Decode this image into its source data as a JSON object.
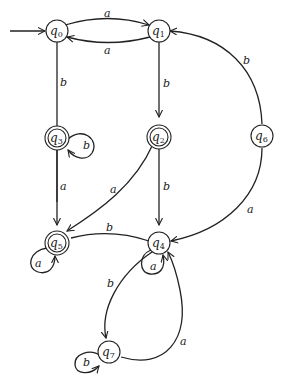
{
  "diagram": {
    "type": "finite-automaton",
    "start_state": "q0",
    "states": [
      {
        "id": "q0",
        "label": "q",
        "sub": "0",
        "accepting": false
      },
      {
        "id": "q1",
        "label": "q",
        "sub": "1",
        "accepting": false
      },
      {
        "id": "q2",
        "label": "q",
        "sub": "2",
        "accepting": true
      },
      {
        "id": "q3",
        "label": "q",
        "sub": "3",
        "accepting": true
      },
      {
        "id": "q4",
        "label": "q",
        "sub": "4",
        "accepting": false
      },
      {
        "id": "q5",
        "label": "q",
        "sub": "5",
        "accepting": true
      },
      {
        "id": "q6",
        "label": "q",
        "sub": "6",
        "accepting": false
      },
      {
        "id": "q7",
        "label": "q",
        "sub": "7",
        "accepting": false
      }
    ],
    "transitions": [
      {
        "from": "q0",
        "to": "q1",
        "symbol": "a"
      },
      {
        "from": "q1",
        "to": "q0",
        "symbol": "a"
      },
      {
        "from": "q0",
        "to": "q3",
        "symbol": "b"
      },
      {
        "from": "q1",
        "to": "q2",
        "symbol": "b"
      },
      {
        "from": "q3",
        "to": "q3",
        "symbol": "b"
      },
      {
        "from": "q3",
        "to": "q5",
        "symbol": "a"
      },
      {
        "from": "q2",
        "to": "q5",
        "symbol": "a"
      },
      {
        "from": "q2",
        "to": "q4",
        "symbol": "b"
      },
      {
        "from": "q6",
        "to": "q1",
        "symbol": "b"
      },
      {
        "from": "q6",
        "to": "q4",
        "symbol": "a"
      },
      {
        "from": "q4",
        "to": "q5",
        "symbol": "b"
      },
      {
        "from": "q5",
        "to": "q5",
        "symbol": "a"
      },
      {
        "from": "q4",
        "to": "q4",
        "symbol": "a"
      },
      {
        "from": "q4",
        "to": "q7",
        "symbol": "b"
      },
      {
        "from": "q7",
        "to": "q4",
        "symbol": "a"
      },
      {
        "from": "q7",
        "to": "q7",
        "symbol": "b"
      }
    ],
    "labels": {
      "a": "a",
      "b": "b"
    }
  }
}
